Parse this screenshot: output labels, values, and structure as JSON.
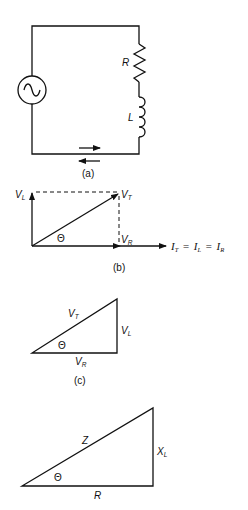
{
  "figure": {
    "part_a": {
      "caption": "(a)",
      "components": {
        "source": "ac-source",
        "resistor_label": "R",
        "inductor_label": "L"
      },
      "current_arrows": [
        "right",
        "left"
      ]
    },
    "part_b": {
      "caption": "(b)",
      "vectors": {
        "vl": {
          "main": "V",
          "sub": "L"
        },
        "vt": {
          "main": "V",
          "sub": "T"
        },
        "vr": {
          "main": "V",
          "sub": "R"
        },
        "theta": "Θ"
      },
      "reference_axis": {
        "i1": {
          "main": "I",
          "sub": "T"
        },
        "eq1": "=",
        "i2": {
          "main": "I",
          "sub": "L"
        },
        "eq2": "=",
        "i3": {
          "main": "I",
          "sub": "R"
        }
      }
    },
    "part_c": {
      "caption": "(c)",
      "hypotenuse": {
        "main": "V",
        "sub": "T"
      },
      "opposite": {
        "main": "V",
        "sub": "L"
      },
      "adjacent": {
        "main": "V",
        "sub": "R"
      },
      "theta": "Θ"
    },
    "part_d": {
      "hypotenuse": "Z",
      "opposite": {
        "main": "X",
        "sub": "L"
      },
      "adjacent": "R",
      "theta": "Θ"
    }
  }
}
